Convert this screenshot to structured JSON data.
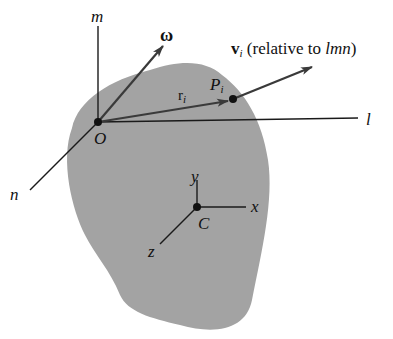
{
  "diagram": {
    "title": "",
    "colors": {
      "body_fill": "#a3a3a3",
      "line": "#1a1a1a",
      "vector": "#444444",
      "background": "#ffffff"
    },
    "frames": {
      "lmn": {
        "origin_label": "O",
        "axes": [
          "l",
          "m",
          "n"
        ]
      },
      "xyz": {
        "origin_label": "C",
        "axes": [
          "x",
          "y",
          "z"
        ]
      }
    },
    "labels": {
      "m": "m",
      "l": "l",
      "n": "n",
      "O": "O",
      "omega": "ω",
      "r_main": "r",
      "r_sub": "i",
      "P_main": "P",
      "P_sub": "i",
      "v_main": "v",
      "v_sub": "i",
      "v_text_prefix": " (relative to ",
      "v_text_italic": "lmn",
      "v_text_suffix": ")",
      "x": "x",
      "y": "y",
      "z": "z",
      "C": "C"
    },
    "vectors": [
      {
        "name": "omega",
        "from": "O",
        "description": "angular velocity"
      },
      {
        "name": "r_i",
        "from": "O",
        "to": "P_i",
        "description": "position vector"
      },
      {
        "name": "v_i",
        "from": "P_i",
        "description": "velocity relative to lmn"
      }
    ]
  }
}
